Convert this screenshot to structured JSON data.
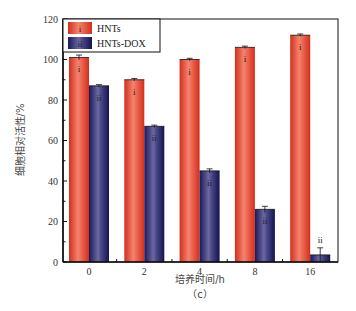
{
  "chart_data": {
    "type": "bar",
    "title": "",
    "xlabel": "培养时间/h",
    "ylabel": "细胞相对活性/%",
    "caption": "（c）",
    "categories": [
      "0",
      "2",
      "4",
      "8",
      "16"
    ],
    "series": [
      {
        "name": "HNTs",
        "marker": "i",
        "color": "#e0402a",
        "values": [
          101,
          90,
          100,
          106,
          112
        ]
      },
      {
        "name": "HNTs-DOX",
        "marker": "ii",
        "color": "#2a2a6e",
        "values": [
          87,
          67,
          45,
          26,
          3.5
        ]
      }
    ],
    "ylim": [
      0,
      120
    ],
    "yticks": [
      0,
      20,
      40,
      60,
      80,
      100,
      120
    ],
    "yminor_step": 10,
    "grid": false,
    "legend_position": "upper-left",
    "error_bars": true
  }
}
